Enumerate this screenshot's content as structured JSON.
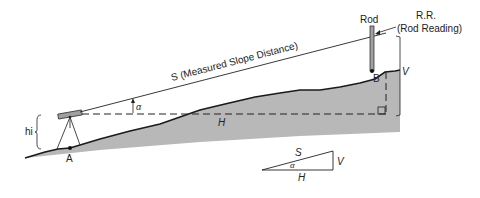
{
  "diagram": {
    "type": "surveying slope distance diagram",
    "labels": {
      "slope_distance": "S (Measured Slope Distance)",
      "rod": "Rod",
      "rod_reading_abbr": "R.R.",
      "rod_reading_full": "(Rod Reading)",
      "vertical": "V",
      "horizontal": "H",
      "angle": "α",
      "instrument_height": "hi",
      "point_a": "A",
      "point_b": "B"
    },
    "triangle_inset": {
      "hypotenuse": "S",
      "vertical": "V",
      "horizontal": "H",
      "angle": "α"
    },
    "colors": {
      "ground_fill": "#b8b8b8",
      "line": "#1a1a1a",
      "instrument": "#a0a0a0",
      "rod": "#a0a0a0"
    }
  }
}
